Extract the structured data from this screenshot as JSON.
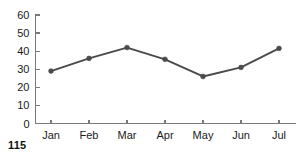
{
  "page": {
    "number": "115"
  },
  "chart_data": {
    "type": "line",
    "title": "",
    "xlabel": "",
    "ylabel": "",
    "categories": [
      "Jan",
      "Feb",
      "Mar",
      "Apr",
      "May",
      "Jun",
      "Jul"
    ],
    "values": [
      29,
      36,
      42,
      35.5,
      26,
      31,
      41.5
    ],
    "series": [
      {
        "name": "series-1",
        "values": [
          29,
          36,
          42,
          35.5,
          26,
          31,
          41.5
        ],
        "color": "#4a4a4a",
        "marker": "circle"
      }
    ],
    "ylim": [
      0,
      60
    ],
    "yticks": [
      0,
      10,
      20,
      30,
      40,
      50,
      60
    ],
    "ytick_labels": [
      "0",
      "10",
      "20",
      "30",
      "40",
      "50",
      "60"
    ],
    "xtick_labels": [
      "Jan",
      "Feb",
      "Mar",
      "Apr",
      "May",
      "Jun",
      "Jul"
    ],
    "grid": false,
    "legend": false,
    "legend_position": "none",
    "axis_color": "#7a7a7a",
    "background": "#ffffff"
  }
}
